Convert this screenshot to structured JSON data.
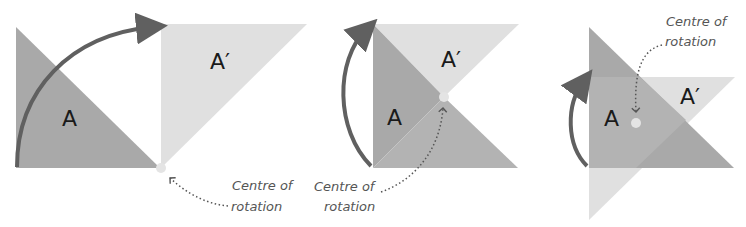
{
  "colors": {
    "original": "#a9a9a9",
    "image": "#e0e0e0",
    "overlap": "#b8b8b8",
    "arrow": "#606060",
    "centre_dot": "#e4e4e4",
    "dotted_line": "#555555",
    "text": "#1a1a1a",
    "note_text": "#555555"
  },
  "panels": [
    {
      "id": "panel-1",
      "original_label": "A",
      "image_label": "A′",
      "note_line1": "Centre of",
      "note_line2": "rotation"
    },
    {
      "id": "panel-2",
      "original_label": "A",
      "image_label": "A′",
      "note_line1": "Centre of",
      "note_line2": "rotation"
    },
    {
      "id": "panel-3",
      "original_label": "A",
      "image_label": "A′",
      "note_line1": "Centre of",
      "note_line2": "rotation"
    }
  ]
}
